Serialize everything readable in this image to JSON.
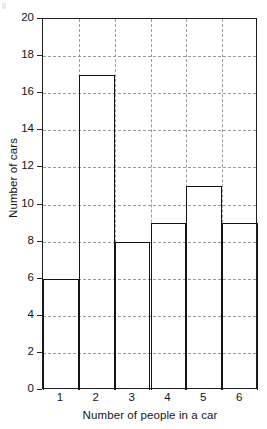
{
  "chart_data": {
    "type": "bar",
    "title": "",
    "subtitle": "",
    "xlabel": "Number of people in a car",
    "ylabel": "Number of cars",
    "categories": [
      "1",
      "2",
      "3",
      "4",
      "5",
      "6"
    ],
    "values": [
      6,
      17,
      8,
      9,
      11,
      9
    ],
    "series": [
      {
        "name": "Number of cars",
        "values": [
          6,
          17,
          8,
          9,
          11,
          9
        ]
      }
    ],
    "ylim": [
      0,
      20
    ],
    "ytick_labels": [
      "0",
      "2",
      "4",
      "6",
      "8",
      "10",
      "12",
      "14",
      "16",
      "18",
      "20"
    ],
    "ytick_values": [
      0,
      2,
      4,
      6,
      8,
      10,
      12,
      14,
      16,
      18,
      20
    ],
    "ytick_step": 2,
    "xtick_labels": [
      "1",
      "2",
      "3",
      "4",
      "5",
      "6"
    ],
    "grid": true,
    "grid_axes": "both",
    "grid_style": "dashed",
    "legend": false,
    "legend_position": "none",
    "bar_fill": "#ffffff",
    "bar_border": "#141414",
    "grid_color": "#9a9a9a",
    "axis_color": "#1d1d1d",
    "text_color": "#151515",
    "background": "#fefefe",
    "bars_contiguous": true,
    "annotations": []
  }
}
